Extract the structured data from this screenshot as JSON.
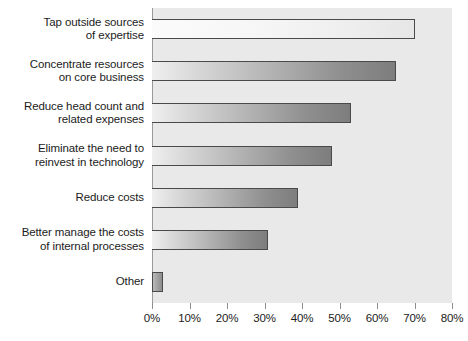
{
  "chart_data": {
    "type": "bar",
    "orientation": "horizontal",
    "title": "",
    "subtitle": "",
    "xlabel": "",
    "ylabel": "",
    "categories": [
      "Tap outside sources\nof expertise",
      "Concentrate resources\non core business",
      "Reduce head count and\nrelated expenses",
      "Eliminate the need to\nreinvest in technology",
      "Reduce costs",
      "Better manage the costs\nof internal processes",
      "Other"
    ],
    "values": [
      70,
      65,
      53,
      48,
      39,
      31,
      3
    ],
    "value_suffix": "%",
    "xlim": [
      0,
      80
    ],
    "xticks": [
      0,
      10,
      20,
      30,
      40,
      50,
      60,
      70,
      80
    ],
    "xtick_labels": [
      "0%",
      "10%",
      "20%",
      "30%",
      "40%",
      "50%",
      "60%",
      "70%",
      "80%"
    ],
    "grid": false,
    "legend": false,
    "legend_position": "none",
    "plot_background": "#e9e9e9",
    "page_background": "#ffffff",
    "bar_border_color": "#4a4a4a",
    "bar_fill_light": "#efefef",
    "bar_fill_dark": "#7d7d7d",
    "text_color": "#1c1c1c",
    "axis_color": "#8d8d8d"
  }
}
